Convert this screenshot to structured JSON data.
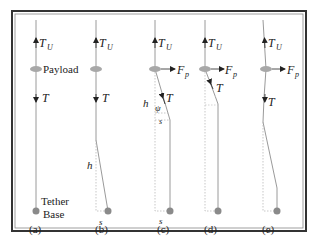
{
  "figure": {
    "panels": [
      {
        "id": "a",
        "caption": "(a)",
        "labels": {
          "top_force": "T",
          "top_sub": "U",
          "payload": "Payload",
          "tension": "T",
          "base_line1": "Tether",
          "base_line2": "Base"
        }
      },
      {
        "id": "b",
        "caption": "(b)",
        "labels": {
          "top_force": "T",
          "top_sub": "U",
          "tension": "T",
          "height": "h",
          "offset": "s"
        }
      },
      {
        "id": "c",
        "caption": "(c)",
        "labels": {
          "top_force": "T",
          "top_sub": "U",
          "side_force": "F",
          "side_sub": "p",
          "tension": "T",
          "height": "h",
          "angle": "ψ",
          "offset_small": "s",
          "offset": "s"
        }
      },
      {
        "id": "d",
        "caption": "(d)",
        "labels": {
          "top_force": "T",
          "top_sub": "U",
          "side_force": "F",
          "side_sub": "p",
          "tension": "T"
        }
      },
      {
        "id": "e",
        "caption": "(e)",
        "labels": {
          "top_force": "T",
          "top_sub": "U",
          "side_force": "F",
          "side_sub": "p",
          "tension": "T"
        }
      }
    ],
    "colors": {
      "frame": "#333333",
      "tether": "#9a9a9a",
      "payload": "#a8a8a8",
      "base": "#8a8a8a",
      "dotted": "#b0b0b0",
      "text": "#222222"
    }
  }
}
